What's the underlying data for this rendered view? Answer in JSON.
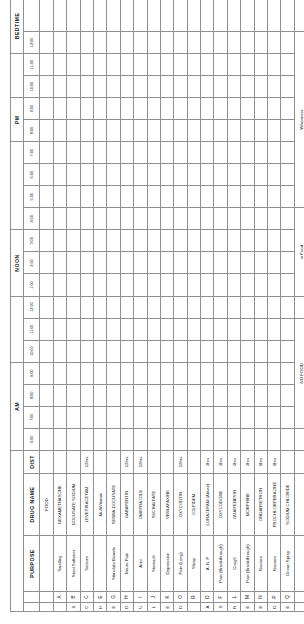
{
  "sheet": {
    "title": "Medication Schedule Grid"
  },
  "columns": {
    "purpose_header": "PURPOSE",
    "drug_header": "DRUG NAME",
    "dist_header": "DIST",
    "food_header": "FOOD"
  },
  "segments": [
    {
      "label": "AM",
      "span": 4
    },
    {
      "label": "",
      "span": 3
    },
    {
      "label": "NOON",
      "span": 3
    },
    {
      "label": "",
      "span": 4
    },
    {
      "label": "PM",
      "span": 2
    },
    {
      "label": "",
      "span": 2
    },
    {
      "label": "BEDTIME",
      "span": 3
    },
    {
      "label": "",
      "span": 2
    }
  ],
  "hours": [
    "6:00",
    "7:00",
    "8:00",
    "9:00",
    "10:00",
    "11:00",
    "12:00",
    "1:00",
    "2:00",
    "3:00",
    "4:00",
    "5:00",
    "6:00",
    "7:00",
    "8:00",
    "9:00",
    "10:00",
    "11:00",
    "12:00"
  ],
  "side_labels": {
    "scheduled": "S C H E D U L E D",
    "as_needed": "A S   N E E D E D"
  },
  "rows": [
    {
      "letter": "A",
      "purpose": "Swelling",
      "drug": "DEXAMETHASONE",
      "dist": "",
      "group": "scheduled",
      "marks": {
        "2": "mid"
      }
    },
    {
      "letter": "B",
      "purpose": "Stool Softener",
      "drug": "DOCUSATE SODIUM",
      "dist": "",
      "group": "scheduled",
      "marks": {}
    },
    {
      "letter": "C",
      "purpose": "Seizure",
      "drug": "LEVETIRACETAM",
      "dist": "12hrs",
      "group": "scheduled",
      "marks": {}
    },
    {
      "letter": "E",
      "purpose": "",
      "drug": "MultiVitamin",
      "dist": "",
      "group": "scheduled",
      "marks": {
        "2": "mid"
      }
    },
    {
      "letter": "G",
      "purpose": "Stimulate Bowels",
      "drug": "SENNA-DOCUSATE",
      "dist": "",
      "group": "scheduled",
      "marks": {}
    },
    {
      "letter": "H",
      "purpose": "Neuro Pain",
      "drug": "GABAPENTIN",
      "dist": "12hrs",
      "group": "scheduled",
      "marks": {}
    },
    {
      "letter": "I",
      "purpose": "Acid",
      "drug": "OMEPRAZOLE",
      "dist": "12hrs",
      "group": "scheduled",
      "marks": {}
    },
    {
      "letter": "J",
      "purpose": "Stomach",
      "drug": "SUCRALFATE",
      "dist": "",
      "group": "scheduled",
      "marks": {}
    },
    {
      "letter": "K",
      "purpose": "Depression",
      "drug": "VENLAFAXINE",
      "dist": "",
      "group": "scheduled",
      "marks": {}
    },
    {
      "letter": "O",
      "purpose": "Pain (Long)",
      "drug": "OXYCODTIN",
      "dist": "12hrs",
      "group": "scheduled",
      "marks": {}
    },
    {
      "letter": "R",
      "purpose": "Sleep",
      "drug": "ZOLPIDEM",
      "dist": "",
      "group": "scheduled",
      "marks": {}
    },
    {
      "letter": "D",
      "purpose": "A, N, P",
      "drug": "LORAZEPAM (Ativan)",
      "dist": "2hrs",
      "group": "asneeded",
      "marks": {}
    },
    {
      "letter": "F",
      "purpose": "Pain (Breakthrough)",
      "drug": "OXYCODONE",
      "dist": "4hrs",
      "group": "asneeded",
      "marks": {}
    },
    {
      "letter": "L",
      "purpose": "Cough",
      "drug": "GUAIFENESIN",
      "dist": "4hrs",
      "group": "asneeded",
      "marks": {}
    },
    {
      "letter": "M",
      "purpose": "Pain (Breakthrough)",
      "drug": "MORPHINE",
      "dist": "2hrs",
      "group": "asneeded",
      "marks": {}
    },
    {
      "letter": "N",
      "purpose": "Nausea",
      "drug": "ONDANSETRON",
      "dist": "6hrs",
      "group": "asneeded",
      "marks": {}
    },
    {
      "letter": "P",
      "purpose": "Nausea",
      "drug": "PROCHLORPERAZINE",
      "dist": "6hrs",
      "group": "asneeded",
      "marks": {}
    },
    {
      "letter": "Q",
      "purpose": "Ocean Spray",
      "drug": "SODIUM CHLORIDE",
      "dist": "",
      "group": "asneeded",
      "marks": {}
    }
  ],
  "food_row": {
    "no_food": "NO FOOD",
    "with_food": "w Food",
    "whenever": "Whenever"
  },
  "legend": {
    "text": "A-Anxiety N-Nausea P-Pain (Lower Level)"
  },
  "dark_marks": [
    {
      "row": 4,
      "hour_index": 1
    },
    {
      "row": 4,
      "hour_index": 5
    },
    {
      "row": 4,
      "hour_index": 10
    },
    {
      "row": 4,
      "hour_index": 14
    }
  ],
  "colors": {
    "grid_line": "#8e9094",
    "tint": "#eceded",
    "dark_cell": "#5e6164",
    "mid_cell": "#a8abae",
    "text": "#15171a"
  }
}
